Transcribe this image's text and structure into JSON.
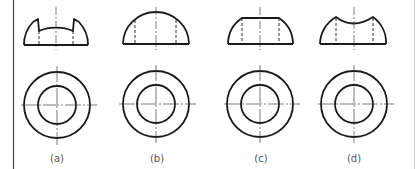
{
  "figure": {
    "stroke_color": "#1a1a1a",
    "centerline_color": "#444444",
    "border_color": "#444444",
    "right_edge_color": "#cfcfcf",
    "background": "#ffffff"
  },
  "views": [
    {
      "id": "a",
      "label": "(a)",
      "front_view_shape": "hemisphere-with-two-notches-and-concave-top",
      "top_view": {
        "outer_circle": true,
        "inner_circle": true,
        "crosshair": true
      }
    },
    {
      "id": "b",
      "label": "(b)",
      "front_view_shape": "plain-hemisphere",
      "top_view": {
        "outer_circle": true,
        "inner_circle": true,
        "crosshair": true
      }
    },
    {
      "id": "c",
      "label": "(c)",
      "front_view_shape": "hemisphere-with-flat-cut-top",
      "top_view": {
        "outer_circle": true,
        "inner_circle": true,
        "crosshair": true
      }
    },
    {
      "id": "d",
      "label": "(d)",
      "front_view_shape": "hemisphere-with-concave-spherical-top",
      "top_view": {
        "outer_circle": true,
        "inner_circle": true,
        "crosshair": true
      }
    }
  ]
}
